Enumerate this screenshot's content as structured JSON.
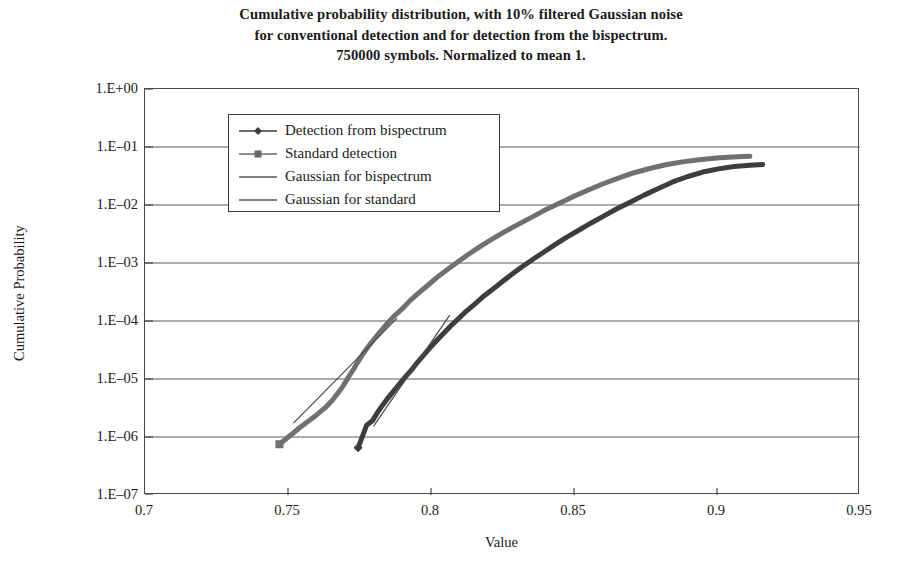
{
  "title": {
    "line1": "Cumulative probability distribution, with 10% filtered Gaussian noise",
    "line2": "for conventional detection and for detection from the bispectrum.",
    "line3": "750000 symbols. Normalized to mean 1."
  },
  "axes": {
    "y_title": "Cumulative Probability",
    "x_title": "Value"
  },
  "legend": {
    "items": [
      {
        "label": "Detection from bispectrum",
        "marker": "diamond-marker-icon",
        "color": "#3d3d3d"
      },
      {
        "label": "Standard detection",
        "marker": "square-marker-icon",
        "color": "#6a6a6a"
      },
      {
        "label": "Gaussian for bispectrum",
        "marker": "line-marker-icon",
        "color": "#555555"
      },
      {
        "label": "Gaussian for standard",
        "marker": "line-marker-icon",
        "color": "#555555"
      }
    ]
  },
  "chart_data": {
    "type": "line",
    "title": "Cumulative probability distribution, with 10% filtered Gaussian noise for conventional detection and for detection from the bispectrum. 750000 symbols. Normalized to mean 1.",
    "xlabel": "Value",
    "ylabel": "Cumulative Probability",
    "xlim": [
      0.7,
      0.95
    ],
    "ylim": [
      1e-07,
      1
    ],
    "yscale": "log",
    "xticks": [
      0.7,
      0.75,
      0.8,
      0.85,
      0.9,
      0.95
    ],
    "xticklabels": [
      "0.7",
      "0.75",
      "0.8",
      "0.85",
      "0.9",
      "0.95"
    ],
    "yticks": [
      1,
      0.1,
      0.01,
      0.001,
      0.0001,
      1e-05,
      1e-06,
      1e-07
    ],
    "yticklabels": [
      "1.E+00",
      "1.E-01",
      "1.E-02",
      "1.E-03",
      "1.E-04",
      "1.E-05",
      "1.E-06",
      "1.E-07"
    ],
    "grid": "horizontal",
    "legend_position": "upper-left-inside",
    "series": [
      {
        "name": "Detection from bispectrum",
        "color": "#3d3d3d",
        "linewidth": 5,
        "x": [
          0.7745,
          0.7775,
          0.7795,
          0.7812,
          0.7828,
          0.7845,
          0.7862,
          0.788,
          0.7898,
          0.7915,
          0.7935,
          0.7955,
          0.7975,
          0.7998,
          0.802,
          0.8045,
          0.807,
          0.8098,
          0.8125,
          0.8155,
          0.8185,
          0.8218,
          0.825,
          0.8285,
          0.832,
          0.8358,
          0.8395,
          0.8435,
          0.8475,
          0.8518,
          0.856,
          0.8605,
          0.865,
          0.8698,
          0.8745,
          0.8795,
          0.8845,
          0.8898,
          0.895,
          0.9005,
          0.906,
          0.9115,
          0.916
        ],
        "y": [
          6.5e-07,
          1.6e-06,
          1.9e-06,
          2.6e-06,
          3.4e-06,
          4.4e-06,
          5.6e-06,
          7.2e-06,
          9.2e-06,
          1.15e-05,
          1.5e-05,
          2e-05,
          2.6e-05,
          3.5e-05,
          4.6e-05,
          6.2e-05,
          8.3e-05,
          0.000112,
          0.00015,
          0.0002,
          0.00027,
          0.00036,
          0.00048,
          0.00065,
          0.00087,
          0.00117,
          0.00155,
          0.0021,
          0.0028,
          0.0037,
          0.0049,
          0.0065,
          0.0086,
          0.0113,
          0.0148,
          0.0193,
          0.025,
          0.031,
          0.037,
          0.042,
          0.046,
          0.0485,
          0.05
        ]
      },
      {
        "name": "Standard detection",
        "color": "#707070",
        "linewidth": 5,
        "x": [
          0.747,
          0.7545,
          0.76,
          0.763,
          0.7655,
          0.7672,
          0.7688,
          0.7702,
          0.7715,
          0.773,
          0.7745,
          0.7762,
          0.778,
          0.78,
          0.7822,
          0.7845,
          0.787,
          0.7898,
          0.7925,
          0.7955,
          0.7988,
          0.802,
          0.8055,
          0.8092,
          0.813,
          0.817,
          0.8212,
          0.8255,
          0.83,
          0.8348,
          0.8395,
          0.8445,
          0.8495,
          0.8548,
          0.86,
          0.8655,
          0.871,
          0.8768,
          0.8825,
          0.8885,
          0.8945,
          0.901,
          0.907,
          0.9115
        ],
        "y": [
          7.5e-07,
          1.5e-06,
          2.4e-06,
          3.2e-06,
          4.3e-06,
          5.5e-06,
          7e-06,
          9e-06,
          1.15e-05,
          1.5e-05,
          2e-05,
          2.7e-05,
          3.6e-05,
          4.8e-05,
          6.5e-05,
          8.8e-05,
          0.00012,
          0.00016,
          0.00022,
          0.0003,
          0.00041,
          0.00056,
          0.00076,
          0.00103,
          0.0014,
          0.0019,
          0.00255,
          0.0034,
          0.0045,
          0.006,
          0.008,
          0.0105,
          0.0138,
          0.018,
          0.023,
          0.029,
          0.036,
          0.043,
          0.05,
          0.056,
          0.061,
          0.065,
          0.068,
          0.069
        ]
      },
      {
        "name": "Gaussian for bispectrum",
        "color": "#4a4a4a",
        "linewidth": 1.2,
        "x": [
          0.78,
          0.8065
        ],
        "y": [
          1.55e-06,
          0.000125
        ]
      },
      {
        "name": "Gaussian for standard",
        "color": "#4a4a4a",
        "linewidth": 1.2,
        "x": [
          0.752,
          0.788
        ],
        "y": [
          1.75e-06,
          0.00011
        ]
      }
    ]
  }
}
